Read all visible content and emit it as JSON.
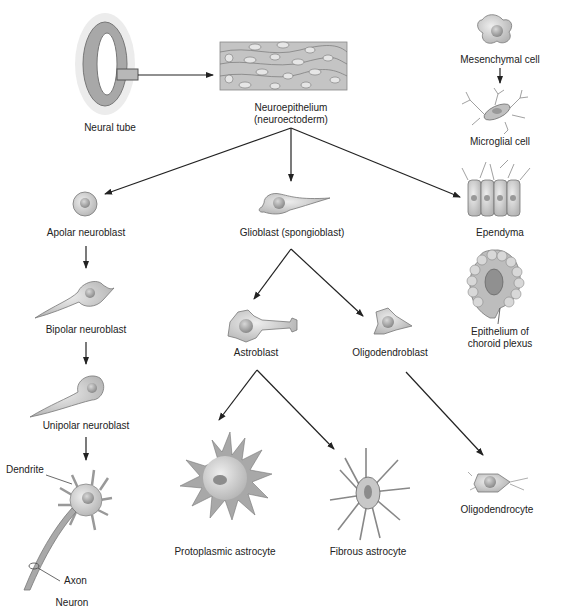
{
  "diagram": {
    "nodes": {
      "neural_tube": "Neural tube",
      "neuroepithelium_1": "Neuroepithelium",
      "neuroepithelium_2": "(neuroectoderm)",
      "mesenchymal_cell": "Mesenchymal cell",
      "microglial_cell": "Microglial cell",
      "apolar_neuroblast": "Apolar neuroblast",
      "glioblast": "Glioblast (spongioblast)",
      "ependyma": "Ependyma",
      "choroid_1": "Epithelium of",
      "choroid_2": "choroid plexus",
      "bipolar_neuroblast": "Bipolar neuroblast",
      "astroblast": "Astroblast",
      "oligodendroblast": "Oligodendroblast",
      "unipolar_neuroblast": "Unipolar neuroblast",
      "dendrite": "Dendrite",
      "axon": "Axon",
      "neuron": "Neuron",
      "protoplasmic_astrocyte": "Protoplasmic astrocyte",
      "fibrous_astrocyte": "Fibrous astrocyte",
      "oligodendrocyte": "Oligodendrocyte"
    },
    "edges": [
      [
        "Neural tube",
        "Neuroepithelium"
      ],
      [
        "Neuroepithelium",
        "Apolar neuroblast"
      ],
      [
        "Neuroepithelium",
        "Glioblast"
      ],
      [
        "Neuroepithelium",
        "Ependyma"
      ],
      [
        "Mesenchymal cell",
        "Microglial cell"
      ],
      [
        "Apolar neuroblast",
        "Bipolar neuroblast"
      ],
      [
        "Bipolar neuroblast",
        "Unipolar neuroblast"
      ],
      [
        "Unipolar neuroblast",
        "Neuron"
      ],
      [
        "Glioblast",
        "Astroblast"
      ],
      [
        "Glioblast",
        "Oligodendroblast"
      ],
      [
        "Astroblast",
        "Protoplasmic astrocyte"
      ],
      [
        "Astroblast",
        "Fibrous astrocyte"
      ],
      [
        "Oligodendroblast",
        "Oligodendrocyte"
      ]
    ],
    "colors": {
      "cell_fill": "#c8c8c8",
      "cell_outline": "#777777",
      "nucleus": "#9a9a9a",
      "arrow": "#222222"
    }
  }
}
